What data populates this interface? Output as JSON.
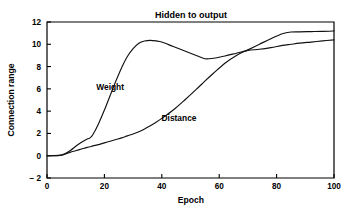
{
  "chart_data": {
    "type": "line",
    "title": "Hidden to output",
    "xlabel": "Epoch",
    "ylabel": "Connection range",
    "xlim": [
      0,
      100
    ],
    "ylim": [
      -2,
      12
    ],
    "xticks": [
      "0",
      "20",
      "40",
      "60",
      "80",
      "100"
    ],
    "xtick_values": [
      0,
      20,
      40,
      60,
      80,
      100
    ],
    "yticks": [
      "12",
      "10",
      "8",
      "6",
      "4",
      "2",
      "0",
      "− 2"
    ],
    "ytick_values": [
      12,
      10,
      8,
      6,
      4,
      2,
      0,
      -2
    ],
    "grid": false,
    "legend": "inline-labels",
    "line_color": "#111111",
    "x": [
      0,
      5,
      8,
      10,
      12,
      14,
      15,
      16,
      18,
      20,
      22,
      24,
      26,
      28,
      30,
      32,
      34,
      36,
      38,
      40,
      44,
      48,
      52,
      55,
      58,
      62,
      66,
      70,
      74,
      78,
      82,
      85,
      88,
      92,
      96,
      100
    ],
    "series": [
      {
        "name": "Weight",
        "label_x": 22,
        "label_y": 5.9,
        "values": [
          0.0,
          0.05,
          0.45,
          0.85,
          1.2,
          1.5,
          1.6,
          1.9,
          2.9,
          4.1,
          5.4,
          6.7,
          7.9,
          8.9,
          9.6,
          10.1,
          10.3,
          10.35,
          10.3,
          10.2,
          9.8,
          9.4,
          9.0,
          8.7,
          8.75,
          8.95,
          9.2,
          9.45,
          9.55,
          9.7,
          9.9,
          10.0,
          10.1,
          10.2,
          10.3,
          10.4
        ]
      },
      {
        "name": "Distance",
        "label_x": 46,
        "label_y": 3.1,
        "values": [
          0.0,
          0.05,
          0.3,
          0.45,
          0.6,
          0.75,
          0.8,
          0.88,
          1.0,
          1.15,
          1.3,
          1.45,
          1.6,
          1.78,
          1.95,
          2.15,
          2.4,
          2.7,
          3.0,
          3.35,
          4.1,
          5.0,
          5.95,
          6.7,
          7.4,
          8.3,
          9.0,
          9.5,
          10.0,
          10.5,
          10.95,
          11.1,
          11.12,
          11.14,
          11.16,
          11.2
        ]
      }
    ]
  }
}
